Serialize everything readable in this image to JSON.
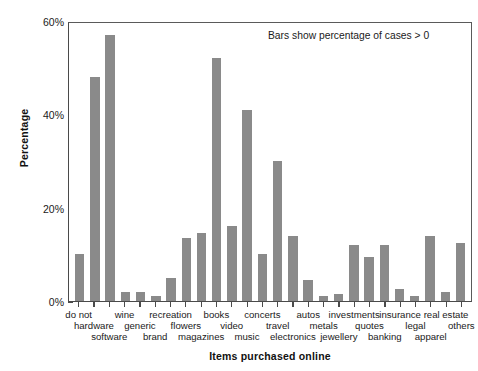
{
  "chart_data": {
    "type": "bar",
    "title": "",
    "xlabel": "Items purchased online",
    "ylabel": "Percentage",
    "ylim": [
      0,
      60
    ],
    "yticks": [
      0,
      20,
      40,
      60
    ],
    "ytick_labels": [
      "0%",
      "20%",
      "40%",
      "60%"
    ],
    "grid": false,
    "legend": null,
    "annotations": [
      "Bars show percentage of cases > 0"
    ],
    "bar_color": "#8a8a8a",
    "categories": [
      "do not",
      "hardware",
      "software",
      "wine",
      "generic",
      "brand",
      "recreation",
      "flowers",
      "magazines",
      "books",
      "video",
      "music",
      "concerts",
      "travel",
      "electronics",
      "autos",
      "metals",
      "jewellery",
      "investments",
      "quotes",
      "banking",
      "insurance",
      "legal",
      "apparel",
      "real estate",
      "others"
    ],
    "values": [
      10.0,
      48.0,
      57.0,
      2.0,
      2.0,
      1.0,
      5.0,
      13.5,
      14.5,
      52.0,
      16.0,
      41.0,
      10.0,
      30.0,
      14.0,
      4.5,
      1.0,
      1.5,
      12.0,
      9.5,
      12.0,
      2.5,
      1.0,
      14.0,
      2.0,
      12.5
    ],
    "label_rows": [
      0,
      1,
      2,
      0,
      1,
      2,
      0,
      1,
      2,
      0,
      1,
      2,
      0,
      1,
      2,
      0,
      1,
      2,
      0,
      1,
      2,
      0,
      1,
      2,
      0,
      1
    ]
  },
  "axis": {
    "y_title": "Percentage",
    "x_title": "Items purchased online"
  },
  "note": {
    "text": "Bars show percentage of cases > 0"
  }
}
